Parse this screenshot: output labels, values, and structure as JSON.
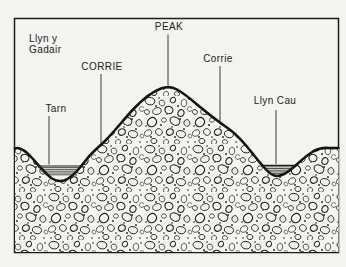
{
  "figure": {
    "title_implied": "Corrie landscape cross-section diagram",
    "colors": {
      "paper": "#f3f3f0",
      "ink": "#1c1c1c"
    },
    "labels": {
      "lake_left_line1": "Llyn y",
      "lake_left_line2": "Gadair",
      "corrie_left": "CORRIE",
      "peak": "PEAK",
      "corrie_right": "Corrie",
      "tarn": "Tarn",
      "lake_right": "Llyn Cau"
    }
  }
}
